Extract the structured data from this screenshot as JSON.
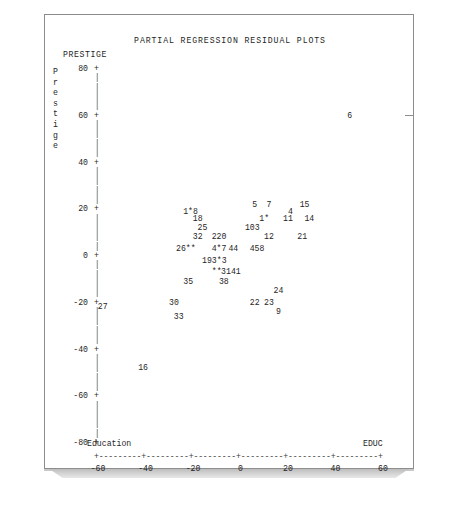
{
  "page": {
    "title": "PARTIAL REGRESSION RESIDUAL PLOTS",
    "corner_label": "PRESTIGE"
  },
  "chart_data": {
    "type": "scatter",
    "title": "PARTIAL REGRESSION RESIDUAL PLOTS",
    "subtitle": "PRESTIGE",
    "xlabel": "Education",
    "xvar": "EDUC",
    "ylabel": "Prestige",
    "yvar": "PRESTIGE",
    "xlim": [
      -60,
      60
    ],
    "ylim": [
      -80,
      80
    ],
    "xticks": [
      "-60",
      "-40",
      "-20",
      "0",
      "20",
      "40",
      "60"
    ],
    "yticks": [
      "80",
      "60",
      "40",
      "20",
      "0",
      "-20",
      "-40",
      "-60",
      "-80"
    ],
    "grid": false,
    "legend": null,
    "points": [
      {
        "label": "6",
        "x": 46,
        "y": 60
      },
      {
        "label": "5",
        "x": 6,
        "y": 22
      },
      {
        "label": "7",
        "x": 12,
        "y": 22
      },
      {
        "label": "15",
        "x": 27,
        "y": 22
      },
      {
        "label": "1*8",
        "x": -21,
        "y": 19
      },
      {
        "label": "4",
        "x": 21,
        "y": 19
      },
      {
        "label": "18",
        "x": -18,
        "y": 16
      },
      {
        "label": "1*",
        "x": 10,
        "y": 16
      },
      {
        "label": "11",
        "x": 20,
        "y": 16
      },
      {
        "label": "14",
        "x": 29,
        "y": 16
      },
      {
        "label": "25",
        "x": -16,
        "y": 12
      },
      {
        "label": "103",
        "x": 5,
        "y": 12
      },
      {
        "label": "32",
        "x": -18,
        "y": 8
      },
      {
        "label": "220",
        "x": -9,
        "y": 8
      },
      {
        "label": "12",
        "x": 12,
        "y": 8
      },
      {
        "label": "21",
        "x": 26,
        "y": 8
      },
      {
        "label": "26**",
        "x": -23,
        "y": 3
      },
      {
        "label": "4*7",
        "x": -9,
        "y": 3
      },
      {
        "label": "44",
        "x": -3,
        "y": 3
      },
      {
        "label": "458",
        "x": 7,
        "y": 3
      },
      {
        "label": "193*3",
        "x": -11,
        "y": -2
      },
      {
        "label": "**",
        "x": -10,
        "y": -7
      },
      {
        "label": "3141",
        "x": -4,
        "y": -7
      },
      {
        "label": "35",
        "x": -22,
        "y": -11
      },
      {
        "label": "38",
        "x": -7,
        "y": -11
      },
      {
        "label": "24",
        "x": 16,
        "y": -15
      },
      {
        "label": "30",
        "x": -28,
        "y": -20
      },
      {
        "label": "22",
        "x": 6,
        "y": -20
      },
      {
        "label": "23",
        "x": 12,
        "y": -20
      },
      {
        "label": "27",
        "x": -58,
        "y": -22
      },
      {
        "label": "9",
        "x": 16,
        "y": -24
      },
      {
        "label": "33",
        "x": -26,
        "y": -26
      },
      {
        "label": "16",
        "x": -41,
        "y": -48
      }
    ]
  },
  "axis": {
    "y_label_chars": [
      "P",
      "r",
      "e",
      "s",
      "t",
      "i",
      "g",
      "e"
    ],
    "x_label_left": "Education",
    "x_label_right": "EDUC",
    "tick_glyph": "+",
    "rule_glyph": "|",
    "axis_line": "+---------+---------+---------+---------+---------+---------+"
  }
}
